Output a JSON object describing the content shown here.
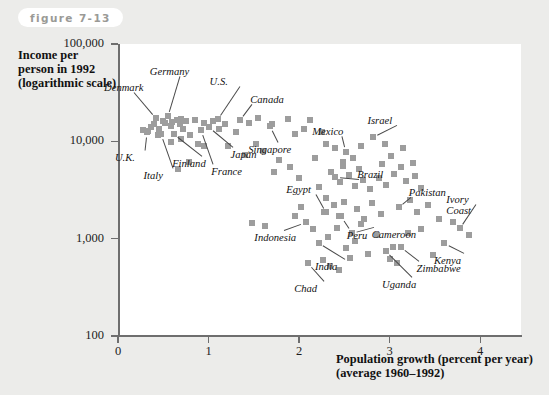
{
  "figure": {
    "label": "figure 7-13"
  },
  "chart_data": {
    "type": "scatter",
    "title": "",
    "xlabel": "Population growth (percent per year)",
    "xlabel_line2": "(average 1960–1992)",
    "ylabel": "Income per person in 1992 (logarithmic scale)",
    "ylabel_lines": [
      "Income per",
      "person in 1992",
      "(logarithmic scale)"
    ],
    "xlim": [
      0,
      4.45
    ],
    "ylim": [
      100,
      100000
    ],
    "yscale": "log",
    "grid": false,
    "legend": null,
    "xticks": [
      0,
      1,
      2,
      3,
      4
    ],
    "xticklabels": [
      "0",
      "1",
      "2",
      "3",
      "4"
    ],
    "yticks": [
      100,
      1000,
      10000,
      100000
    ],
    "yticklabels": [
      "100",
      "1,000",
      "10,000",
      "100,000"
    ],
    "labeled_points": [
      {
        "name": "Denmark",
        "x": 0.42,
        "y": 17500
      },
      {
        "name": "Germany",
        "x": 0.55,
        "y": 18000
      },
      {
        "name": "U.S.",
        "x": 1.1,
        "y": 17000
      },
      {
        "name": "Canada",
        "x": 1.35,
        "y": 16500
      },
      {
        "name": "U.K.",
        "x": 0.32,
        "y": 12500
      },
      {
        "name": "Italy",
        "x": 0.48,
        "y": 12000
      },
      {
        "name": "Finland",
        "x": 0.62,
        "y": 12000
      },
      {
        "name": "Japan",
        "x": 1.0,
        "y": 14000
      },
      {
        "name": "France",
        "x": 0.92,
        "y": 13000
      },
      {
        "name": "Singapore",
        "x": 1.68,
        "y": 14500
      },
      {
        "name": "Mexico",
        "x": 2.52,
        "y": 7800
      },
      {
        "name": "Israel",
        "x": 2.82,
        "y": 11000
      },
      {
        "name": "Brazil",
        "x": 2.4,
        "y": 4300
      },
      {
        "name": "Egypt",
        "x": 2.3,
        "y": 1900
      },
      {
        "name": "Peru",
        "x": 2.46,
        "y": 1700
      },
      {
        "name": "Pakistan",
        "x": 3.1,
        "y": 2100
      },
      {
        "name": "Indonesia",
        "x": 2.08,
        "y": 1500
      },
      {
        "name": "India",
        "x": 2.22,
        "y": 900
      },
      {
        "name": "Cameroon",
        "x": 2.58,
        "y": 1150
      },
      {
        "name": "Chad",
        "x": 2.1,
        "y": 560
      },
      {
        "name": "Uganda",
        "x": 2.96,
        "y": 750
      },
      {
        "name": "Zimbabwe",
        "x": 3.12,
        "y": 830
      },
      {
        "name": "Kenya",
        "x": 3.6,
        "y": 900
      },
      {
        "name": "Ivory Coast",
        "x": 3.78,
        "y": 1300
      }
    ],
    "annotations": [
      {
        "text": "Denmark",
        "lines": [
          "Denmark"
        ]
      },
      {
        "text": "Germany",
        "lines": [
          "Germany"
        ]
      },
      {
        "text": "U.S.",
        "lines": [
          "U.S."
        ]
      },
      {
        "text": "Canada",
        "lines": [
          "Canada"
        ]
      },
      {
        "text": "U.K.",
        "lines": [
          "U.K."
        ]
      },
      {
        "text": "Italy",
        "lines": [
          "Italy"
        ]
      },
      {
        "text": "Finland",
        "lines": [
          "Finland"
        ]
      },
      {
        "text": "Japan",
        "lines": [
          "Japan"
        ]
      },
      {
        "text": "France",
        "lines": [
          "France"
        ]
      },
      {
        "text": "Singapore",
        "lines": [
          "Singapore"
        ]
      },
      {
        "text": "Mexico",
        "lines": [
          "Mexico"
        ]
      },
      {
        "text": "Israel",
        "lines": [
          "Israel"
        ]
      },
      {
        "text": "Brazil",
        "lines": [
          "Brazil"
        ]
      },
      {
        "text": "Egypt",
        "lines": [
          "Egypt"
        ]
      },
      {
        "text": "Peru",
        "lines": [
          "Peru"
        ]
      },
      {
        "text": "Pakistan",
        "lines": [
          "Pakistan"
        ]
      },
      {
        "text": "Indonesia",
        "lines": [
          "Indonesia"
        ]
      },
      {
        "text": "India",
        "lines": [
          "India"
        ]
      },
      {
        "text": "Cameroon",
        "lines": [
          "Cameroon"
        ]
      },
      {
        "text": "Chad",
        "lines": [
          "Chad"
        ]
      },
      {
        "text": "Uganda",
        "lines": [
          "Uganda"
        ]
      },
      {
        "text": "Zimbabwe",
        "lines": [
          "Zimbabwe"
        ]
      },
      {
        "text": "Kenya",
        "lines": [
          "Kenya"
        ]
      },
      {
        "text": "Ivory Coast",
        "lines": [
          "Ivory",
          "Coast"
        ]
      }
    ],
    "points": [
      [
        0.28,
        13000
      ],
      [
        0.33,
        12800
      ],
      [
        0.36,
        14000
      ],
      [
        0.4,
        15000
      ],
      [
        0.42,
        17500
      ],
      [
        0.45,
        13500
      ],
      [
        0.47,
        12000
      ],
      [
        0.5,
        16000
      ],
      [
        0.52,
        15500
      ],
      [
        0.55,
        18000
      ],
      [
        0.58,
        14500
      ],
      [
        0.6,
        15800
      ],
      [
        0.62,
        12000
      ],
      [
        0.65,
        16500
      ],
      [
        0.68,
        15000
      ],
      [
        0.7,
        17000
      ],
      [
        0.72,
        13500
      ],
      [
        0.75,
        16000
      ],
      [
        0.48,
        12000
      ],
      [
        0.44,
        11500
      ],
      [
        0.85,
        16500
      ],
      [
        0.92,
        13000
      ],
      [
        0.95,
        15500
      ],
      [
        1.0,
        14000
      ],
      [
        1.05,
        16000
      ],
      [
        1.1,
        17000
      ],
      [
        0.88,
        9500
      ],
      [
        0.95,
        9000
      ],
      [
        1.12,
        13500
      ],
      [
        1.18,
        15000
      ],
      [
        1.35,
        16500
      ],
      [
        1.45,
        15500
      ],
      [
        1.3,
        12500
      ],
      [
        0.78,
        6200
      ],
      [
        0.66,
        5200
      ],
      [
        1.55,
        17500
      ],
      [
        1.68,
        14500
      ],
      [
        1.7,
        15000
      ],
      [
        1.52,
        9500
      ],
      [
        1.6,
        8000
      ],
      [
        1.88,
        17000
      ],
      [
        1.95,
        12000
      ],
      [
        2.05,
        13500
      ],
      [
        2.12,
        16500
      ],
      [
        2.25,
        12500
      ],
      [
        1.78,
        6500
      ],
      [
        1.72,
        4800
      ],
      [
        1.9,
        5500
      ],
      [
        2.0,
        4200
      ],
      [
        2.18,
        6800
      ],
      [
        2.3,
        9500
      ],
      [
        2.4,
        8500
      ],
      [
        2.52,
        7800
      ],
      [
        2.48,
        6200
      ],
      [
        2.6,
        6800
      ],
      [
        2.68,
        9000
      ],
      [
        2.82,
        11000
      ],
      [
        2.95,
        9500
      ],
      [
        3.02,
        7000
      ],
      [
        3.15,
        8500
      ],
      [
        2.35,
        4800
      ],
      [
        2.4,
        4300
      ],
      [
        2.45,
        3800
      ],
      [
        2.55,
        4500
      ],
      [
        2.62,
        3500
      ],
      [
        2.7,
        4000
      ],
      [
        2.78,
        3200
      ],
      [
        2.88,
        4200
      ],
      [
        2.96,
        3600
      ],
      [
        3.05,
        4600
      ],
      [
        3.18,
        3900
      ],
      [
        3.28,
        4400
      ],
      [
        3.35,
        3300
      ],
      [
        2.22,
        3400
      ],
      [
        2.3,
        2600
      ],
      [
        2.28,
        1900
      ],
      [
        2.38,
        2200
      ],
      [
        2.44,
        1700
      ],
      [
        2.5,
        2400
      ],
      [
        2.58,
        1150
      ],
      [
        2.64,
        2000
      ],
      [
        2.72,
        1600
      ],
      [
        2.8,
        2300
      ],
      [
        2.9,
        1800
      ],
      [
        3.1,
        2100
      ],
      [
        3.22,
        2500
      ],
      [
        3.3,
        1900
      ],
      [
        3.42,
        2200
      ],
      [
        3.55,
        1600
      ],
      [
        2.08,
        1500
      ],
      [
        2.15,
        1250
      ],
      [
        2.22,
        900
      ],
      [
        2.32,
        1050
      ],
      [
        2.42,
        1300
      ],
      [
        2.52,
        800
      ],
      [
        2.62,
        950
      ],
      [
        2.68,
        1400
      ],
      [
        2.76,
        700
      ],
      [
        2.86,
        1100
      ],
      [
        2.96,
        750
      ],
      [
        3.04,
        820
      ],
      [
        3.12,
        830
      ],
      [
        3.2,
        1150
      ],
      [
        3.35,
        1250
      ],
      [
        3.48,
        680
      ],
      [
        3.6,
        900
      ],
      [
        3.7,
        1500
      ],
      [
        3.78,
        1300
      ],
      [
        3.88,
        1100
      ],
      [
        2.1,
        560
      ],
      [
        2.26,
        600
      ],
      [
        2.34,
        520
      ],
      [
        2.56,
        640
      ],
      [
        2.44,
        480
      ],
      [
        3.0,
        620
      ],
      [
        3.08,
        560
      ],
      [
        1.48,
        1450
      ],
      [
        1.62,
        1350
      ],
      [
        1.95,
        1700
      ],
      [
        2.02,
        2100
      ],
      [
        0.58,
        9800
      ],
      [
        0.7,
        10500
      ],
      [
        0.8,
        11500
      ],
      [
        1.22,
        9000
      ],
      [
        1.4,
        7200
      ],
      [
        2.48,
        5600
      ],
      [
        2.66,
        5200
      ],
      [
        2.92,
        5800
      ],
      [
        3.12,
        5400
      ],
      [
        3.26,
        6000
      ]
    ]
  },
  "colors": {
    "marker": "#9d9d9d",
    "axis": "#6e6e6e",
    "plot_bg": "#ffffff",
    "page_bg": "#ececea",
    "pill_text": "#9a9a96"
  }
}
